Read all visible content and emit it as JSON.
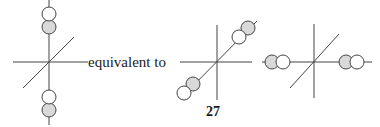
{
  "text": {
    "relation": "equivalent to",
    "page_number": "27"
  },
  "colors": {
    "line": "#444444",
    "filled_circle": "#d9d9d9",
    "open_circle": "#ffffff",
    "text": "#1a1a1a"
  },
  "diagrams": [
    {
      "name": "axes-vertical-orbital",
      "center": [
        49,
        62
      ],
      "lobes": [
        {
          "position": "top",
          "order": [
            "open",
            "filled"
          ]
        },
        {
          "position": "bottom",
          "order": [
            "open",
            "filled"
          ]
        }
      ]
    },
    {
      "name": "axes-diagonal-orbital",
      "center": [
        217,
        62
      ],
      "lobes": [
        {
          "position": "upper-right",
          "order": [
            "open",
            "filled"
          ]
        },
        {
          "position": "lower-left",
          "order": [
            "filled",
            "open"
          ]
        }
      ]
    },
    {
      "name": "axes-horizontal-orbital",
      "center": [
        314,
        62
      ],
      "lobes": [
        {
          "position": "left",
          "order": [
            "filled",
            "open"
          ]
        },
        {
          "position": "right",
          "order": [
            "filled",
            "open"
          ]
        }
      ]
    }
  ]
}
